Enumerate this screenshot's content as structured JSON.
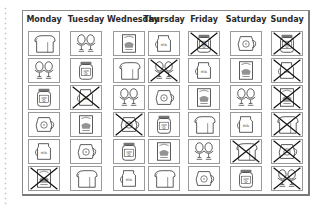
{
  "worksheet": {
    "days": [
      "Monday",
      "Tuesday",
      "Wednesday",
      "Thursday",
      "Friday",
      "Saturday",
      "Sunday"
    ],
    "columns": [
      {
        "day": "Monday",
        "items": [
          {
            "food": "bread",
            "crossed": false
          },
          {
            "food": "eggs",
            "crossed": false
          },
          {
            "food": "jam",
            "crossed": false
          },
          {
            "food": "juice",
            "crossed": false
          },
          {
            "food": "milk",
            "crossed": false
          },
          {
            "food": "cereal",
            "crossed": true
          }
        ]
      },
      {
        "day": "Tuesday",
        "items": [
          {
            "food": "eggs",
            "crossed": false
          },
          {
            "food": "jam",
            "crossed": false
          },
          {
            "food": "milk",
            "crossed": true
          },
          {
            "food": "cereal",
            "crossed": false
          },
          {
            "food": "juice",
            "crossed": false
          },
          {
            "food": "bread",
            "crossed": false
          }
        ]
      },
      {
        "day": "Wednesday",
        "items": [
          {
            "food": "cereal",
            "crossed": false
          },
          {
            "food": "bread",
            "crossed": false
          },
          {
            "food": "eggs",
            "crossed": false
          },
          {
            "food": "juice",
            "crossed": true
          },
          {
            "food": "jam",
            "crossed": false
          },
          {
            "food": "milk",
            "crossed": false
          }
        ]
      },
      {
        "day": "Thursday",
        "items": [
          {
            "food": "milk",
            "crossed": false
          },
          {
            "food": "eggs",
            "crossed": true
          },
          {
            "food": "juice",
            "crossed": false
          },
          {
            "food": "jam",
            "crossed": false
          },
          {
            "food": "cereal",
            "crossed": false
          },
          {
            "food": "bread",
            "crossed": false
          }
        ]
      },
      {
        "day": "Friday",
        "items": [
          {
            "food": "jam",
            "crossed": true
          },
          {
            "food": "milk",
            "crossed": false
          },
          {
            "food": "cereal",
            "crossed": false
          },
          {
            "food": "bread",
            "crossed": false
          },
          {
            "food": "eggs",
            "crossed": false
          },
          {
            "food": "juice",
            "crossed": false
          }
        ]
      },
      {
        "day": "Saturday",
        "items": [
          {
            "food": "juice",
            "crossed": false
          },
          {
            "food": "cereal",
            "crossed": false
          },
          {
            "food": "eggs",
            "crossed": false
          },
          {
            "food": "milk",
            "crossed": false
          },
          {
            "food": "bread",
            "crossed": true
          },
          {
            "food": "jam",
            "crossed": false
          }
        ]
      },
      {
        "day": "Sunday",
        "items": [
          {
            "food": "jam",
            "crossed": true
          },
          {
            "food": "milk",
            "crossed": true
          },
          {
            "food": "cereal",
            "crossed": true
          },
          {
            "food": "bread",
            "crossed": true
          },
          {
            "food": "juice",
            "crossed": true
          },
          {
            "food": "eggs",
            "crossed": true
          }
        ]
      }
    ],
    "milk_label": "Milk",
    "jam_label": "JAM",
    "colors": {
      "line": "#3a3a3a",
      "cross": "#111111",
      "border": "#9a9a9a"
    }
  }
}
